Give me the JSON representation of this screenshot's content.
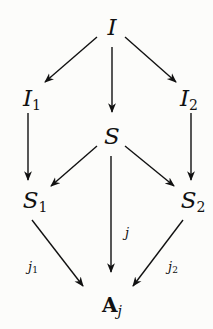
{
  "diagram": {
    "type": "commutative-diagram",
    "nodes": [
      {
        "id": "I",
        "base": "I",
        "sub": ""
      },
      {
        "id": "I1",
        "base": "I",
        "sub": "1"
      },
      {
        "id": "I2",
        "base": "I",
        "sub": "2"
      },
      {
        "id": "S",
        "base": "S",
        "sub": ""
      },
      {
        "id": "S1",
        "base": "S",
        "sub": "1"
      },
      {
        "id": "S2",
        "base": "S",
        "sub": "2"
      },
      {
        "id": "Aj",
        "base": "A",
        "sub": "j"
      }
    ],
    "edges": [
      {
        "from": "I",
        "to": "I1",
        "label": ""
      },
      {
        "from": "I",
        "to": "S",
        "label": ""
      },
      {
        "from": "I",
        "to": "I2",
        "label": ""
      },
      {
        "from": "I1",
        "to": "S1",
        "label": ""
      },
      {
        "from": "I2",
        "to": "S2",
        "label": ""
      },
      {
        "from": "S",
        "to": "S1",
        "label": ""
      },
      {
        "from": "S",
        "to": "S2",
        "label": ""
      },
      {
        "from": "S",
        "to": "Aj",
        "label": "j"
      },
      {
        "from": "S1",
        "to": "Aj",
        "label": "j1"
      },
      {
        "from": "S2",
        "to": "Aj",
        "label": "j2"
      }
    ],
    "labels": {
      "j": {
        "base": "j",
        "sub": ""
      },
      "j1": {
        "base": "j",
        "sub": "1"
      },
      "j2": {
        "base": "j",
        "sub": "2"
      }
    }
  }
}
